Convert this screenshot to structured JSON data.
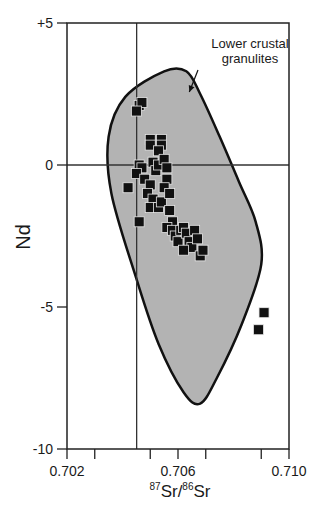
{
  "chart_data": {
    "type": "scatter",
    "title": "",
    "xlabel": "87Sr/86Sr",
    "xlabel_parts": {
      "sup1": "87",
      "base1": "Sr/",
      "sup2": "86",
      "base2": "Sr"
    },
    "ylabel": "Nd",
    "xlim": [
      0.702,
      0.71
    ],
    "ylim": [
      -10,
      5
    ],
    "x_ticks": [
      0.702,
      0.703,
      0.704,
      0.705,
      0.706,
      0.707,
      0.708,
      0.709,
      0.71
    ],
    "x_tick_labels": [
      {
        "value": 0.702,
        "label": "0.702"
      },
      {
        "value": 0.706,
        "label": "0.706"
      },
      {
        "value": 0.71,
        "label": "0.710"
      }
    ],
    "y_tick_labels": [
      {
        "value": 5,
        "label": "+5"
      },
      {
        "value": 0,
        "label": "0"
      },
      {
        "value": -5,
        "label": "-5"
      },
      {
        "value": -10,
        "label": "-10"
      }
    ],
    "grid": false,
    "reference_lines": {
      "vertical_x": 0.70451,
      "horizontal_y": 0
    },
    "field": {
      "name": "Lower crustal granulites",
      "fill": "#b3b3b3",
      "outline_approx": [
        [
          0.7063,
          3.3
        ],
        [
          0.7068,
          2.5
        ],
        [
          0.7075,
          1.0
        ],
        [
          0.7082,
          -0.6
        ],
        [
          0.7088,
          -2.0
        ],
        [
          0.709,
          -3.5
        ],
        [
          0.7083,
          -5.6
        ],
        [
          0.7074,
          -7.5
        ],
        [
          0.7068,
          -8.4
        ],
        [
          0.7062,
          -8.0
        ],
        [
          0.7053,
          -6.3
        ],
        [
          0.7045,
          -4.0
        ],
        [
          0.7036,
          -1.0
        ],
        [
          0.7035,
          1.0
        ],
        [
          0.7041,
          2.4
        ],
        [
          0.7055,
          3.3
        ]
      ]
    },
    "annotation": {
      "text_line1": "Lower crustal",
      "text_line2": "granulites",
      "arrow_to": [
        0.7063,
        2.5
      ]
    },
    "series": [
      {
        "name": "Samples",
        "marker": "square",
        "color": "#111111",
        "points": [
          [
            0.7046,
            2.1
          ],
          [
            0.7047,
            2.2
          ],
          [
            0.7045,
            1.9
          ],
          [
            0.705,
            0.9
          ],
          [
            0.705,
            0.7
          ],
          [
            0.7054,
            0.9
          ],
          [
            0.7054,
            0.7
          ],
          [
            0.7053,
            0.5
          ],
          [
            0.7046,
            0.0
          ],
          [
            0.7047,
            -0.1
          ],
          [
            0.7045,
            -0.3
          ],
          [
            0.7051,
            0.1
          ],
          [
            0.7052,
            -0.2
          ],
          [
            0.7053,
            0.0
          ],
          [
            0.7055,
            0.2
          ],
          [
            0.7056,
            -0.1
          ],
          [
            0.7056,
            -0.5
          ],
          [
            0.7055,
            -0.8
          ],
          [
            0.7048,
            -0.5
          ],
          [
            0.705,
            -0.7
          ],
          [
            0.7049,
            -1.0
          ],
          [
            0.7051,
            -1.2
          ],
          [
            0.705,
            -1.5
          ],
          [
            0.7053,
            -1.5
          ],
          [
            0.7054,
            -1.3
          ],
          [
            0.7057,
            -1.0
          ],
          [
            0.7057,
            -1.6
          ],
          [
            0.7058,
            -2.0
          ],
          [
            0.7042,
            -0.8
          ],
          [
            0.7046,
            -2.0
          ],
          [
            0.7056,
            -2.2
          ],
          [
            0.7058,
            -2.3
          ],
          [
            0.7059,
            -2.5
          ],
          [
            0.7061,
            -2.3
          ],
          [
            0.706,
            -2.7
          ],
          [
            0.7062,
            -2.2
          ],
          [
            0.7063,
            -2.4
          ],
          [
            0.7064,
            -2.7
          ],
          [
            0.7066,
            -2.3
          ],
          [
            0.7065,
            -2.9
          ],
          [
            0.7062,
            -3.0
          ],
          [
            0.7067,
            -2.6
          ],
          [
            0.7068,
            -3.2
          ],
          [
            0.7069,
            -3.0
          ],
          [
            0.7091,
            -5.2
          ],
          [
            0.7089,
            -5.8
          ]
        ]
      }
    ]
  }
}
